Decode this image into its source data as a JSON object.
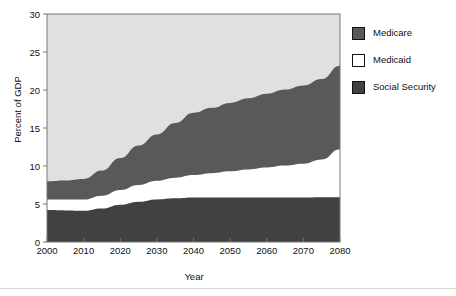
{
  "chart_data": {
    "type": "area",
    "stacked": true,
    "title": "",
    "xlabel": "Year",
    "ylabel": "Percent of GDP",
    "xlim": [
      2000,
      2080
    ],
    "ylim": [
      0,
      30
    ],
    "xticks": [
      2000,
      2010,
      2020,
      2030,
      2040,
      2050,
      2060,
      2070,
      2080
    ],
    "yticks": [
      0,
      5,
      10,
      15,
      20,
      25,
      30
    ],
    "grid": false,
    "legend_position": "right",
    "x": [
      2000,
      2005,
      2010,
      2015,
      2020,
      2025,
      2030,
      2035,
      2040,
      2045,
      2050,
      2055,
      2060,
      2065,
      2070,
      2075,
      2080
    ],
    "series": [
      {
        "name": "Social Security",
        "color": "#414141",
        "values": [
          4.2,
          4.15,
          4.1,
          4.4,
          4.9,
          5.3,
          5.6,
          5.75,
          5.85,
          5.85,
          5.85,
          5.85,
          5.85,
          5.85,
          5.85,
          5.9,
          5.9
        ]
      },
      {
        "name": "Medicaid",
        "color": "#ffffff",
        "values": [
          1.4,
          1.45,
          1.5,
          1.7,
          1.95,
          2.2,
          2.45,
          2.7,
          2.95,
          3.2,
          3.45,
          3.7,
          3.95,
          4.2,
          4.45,
          4.95,
          6.3
        ]
      },
      {
        "name": "Medicare",
        "color": "#595959",
        "values": [
          2.4,
          2.5,
          2.7,
          3.3,
          4.2,
          5.2,
          6.1,
          7.2,
          8.2,
          8.6,
          9.0,
          9.35,
          9.7,
          10.0,
          10.3,
          10.6,
          11.0
        ]
      }
    ],
    "cumulative_tops": {
      "social_security": [
        4.2,
        4.15,
        4.1,
        4.4,
        4.9,
        5.3,
        5.6,
        5.75,
        5.85,
        5.85,
        5.85,
        5.85,
        5.85,
        5.85,
        5.85,
        5.9,
        5.9
      ],
      "medicaid": [
        5.6,
        5.6,
        5.6,
        6.1,
        6.85,
        7.5,
        8.05,
        8.45,
        8.8,
        9.05,
        9.3,
        9.55,
        9.8,
        10.05,
        10.3,
        10.85,
        12.2
      ],
      "medicare": [
        8.0,
        8.1,
        8.3,
        9.4,
        11.05,
        12.7,
        14.15,
        15.65,
        17.0,
        17.65,
        18.3,
        18.9,
        19.5,
        20.05,
        20.6,
        21.45,
        23.2
      ]
    }
  },
  "legend": {
    "items": [
      {
        "label": "Medicare",
        "color": "#595959"
      },
      {
        "label": "Medicaid",
        "color": "#ffffff"
      },
      {
        "label": "Social Security",
        "color": "#414141"
      }
    ]
  },
  "axes": {
    "x_title": "Year",
    "y_title": "Percent of GDP",
    "x_tick_labels": [
      "2000",
      "2010",
      "2020",
      "2030",
      "2040",
      "2050",
      "2060",
      "2070",
      "2080"
    ],
    "y_tick_labels": [
      "0",
      "5",
      "10",
      "15",
      "20",
      "25",
      "30"
    ]
  },
  "colors": {
    "plot_background": "#e0e0e0",
    "medicare": "#595959",
    "medicaid": "#ffffff",
    "social_security": "#414141",
    "axis": "#777777",
    "text": "#111111"
  }
}
